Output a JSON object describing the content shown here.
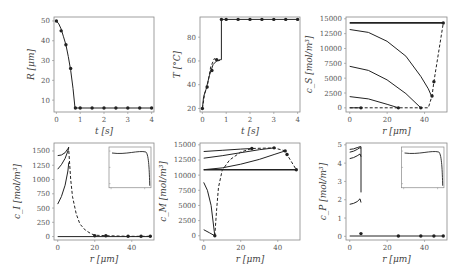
{
  "chart_data": [
    {
      "type": "line",
      "id": "radius",
      "xlabel": "t [s]",
      "ylabel": "R [μm]",
      "xlim": [
        -0.1,
        4.1
      ],
      "ylim": [
        4,
        52
      ],
      "xticks": [
        0,
        1,
        2,
        3,
        4
      ],
      "yticks": [
        10,
        20,
        30,
        40,
        50
      ],
      "series": [
        {
          "name": "solid",
          "style": "solid",
          "x": [
            0,
            0.1,
            0.2,
            0.3,
            0.4,
            0.5,
            0.6,
            0.7,
            0.78,
            0.8,
            1,
            1.5,
            2,
            2.5,
            3,
            3.5,
            4
          ],
          "y": [
            50,
            48.5,
            46,
            42,
            38,
            32,
            25,
            16,
            6,
            6,
            6,
            6,
            6,
            6,
            6,
            6,
            6
          ]
        },
        {
          "name": "markers",
          "style": "markers",
          "x": [
            0,
            0.2,
            0.4,
            0.6,
            0.8,
            1,
            1.5,
            2,
            2.5,
            3,
            3.5,
            4
          ],
          "y": [
            50,
            45,
            38,
            26,
            6,
            6,
            6,
            6,
            6,
            6,
            6,
            6
          ]
        }
      ]
    },
    {
      "type": "line",
      "id": "temperature",
      "xlabel": "t [s]",
      "ylabel": "T [°C]",
      "xlim": [
        -0.1,
        4.1
      ],
      "ylim": [
        17,
        97
      ],
      "xticks": [
        0,
        1,
        2,
        3,
        4
      ],
      "yticks": [
        20,
        40,
        60,
        80
      ],
      "series": [
        {
          "name": "solid",
          "style": "solid",
          "x": [
            0,
            0.05,
            0.15,
            0.3,
            0.45,
            0.6,
            0.75,
            0.8,
            0.8,
            4
          ],
          "y": [
            20,
            30,
            36,
            48,
            57,
            60,
            61,
            61,
            95,
            95
          ]
        },
        {
          "name": "dashed",
          "style": "dashed",
          "x": [
            0,
            0.1,
            0.2,
            0.35,
            0.5,
            0.65,
            0.8
          ],
          "y": [
            20,
            33,
            38,
            55,
            62,
            60,
            61
          ]
        },
        {
          "name": "markers",
          "style": "markers",
          "x": [
            0,
            0.2,
            0.4,
            0.6,
            0.8,
            1,
            1.5,
            2,
            2.5,
            3,
            3.5,
            4
          ],
          "y": [
            20,
            38,
            52,
            61,
            95,
            95,
            95,
            95,
            95,
            95,
            95,
            95
          ]
        }
      ]
    },
    {
      "type": "line",
      "id": "c_S",
      "xlabel": "r [μm]",
      "ylabel": "c_S [mol/m³]",
      "xlim": [
        -2,
        52
      ],
      "ylim": [
        -700,
        15300
      ],
      "xticks": [
        0,
        20,
        40
      ],
      "yticks": [
        0,
        2500,
        5000,
        7500,
        10000,
        12500,
        15000
      ],
      "series": [
        {
          "name": "t0",
          "style": "solid",
          "x": [
            0,
            50
          ],
          "y": [
            14300,
            14300
          ]
        },
        {
          "name": "t1",
          "style": "solid",
          "x": [
            0,
            10,
            20,
            30,
            38,
            42,
            44
          ],
          "y": [
            13200,
            12700,
            11200,
            8700,
            5300,
            3200,
            1800
          ]
        },
        {
          "name": "t2",
          "style": "solid",
          "x": [
            0,
            10,
            20,
            30,
            38
          ],
          "y": [
            7000,
            6300,
            4700,
            2400,
            0
          ]
        },
        {
          "name": "t3",
          "style": "solid",
          "x": [
            0,
            10,
            20,
            26
          ],
          "y": [
            1900,
            1500,
            600,
            0
          ]
        },
        {
          "name": "t4",
          "style": "solid",
          "x": [
            0,
            6
          ],
          "y": [
            0,
            0
          ]
        },
        {
          "name": "surface",
          "style": "dashed",
          "x": [
            0,
            6,
            26,
            38,
            42,
            44,
            45,
            50
          ],
          "y": [
            0,
            0,
            0,
            0,
            0,
            2000,
            4400,
            14300
          ]
        },
        {
          "name": "markers",
          "style": "markers",
          "x": [
            6,
            26,
            38,
            44,
            45,
            50
          ],
          "y": [
            0,
            0,
            0,
            2000,
            4400,
            14300
          ]
        }
      ]
    },
    {
      "type": "line",
      "id": "c_I",
      "xlabel": "r [μm]",
      "ylabel": "c_I [mol/m³]",
      "xlim": [
        -2,
        52
      ],
      "ylim": [
        -60,
        1640
      ],
      "xticks": [
        0,
        20,
        40
      ],
      "yticks": [
        0,
        250,
        500,
        750,
        1000,
        1250,
        1500
      ],
      "inset": true,
      "series": [
        {
          "name": "t1",
          "style": "solid",
          "x": [
            0,
            2,
            4,
            5.5,
            6
          ],
          "y": [
            1420,
            1430,
            1470,
            1540,
            1570
          ]
        },
        {
          "name": "t2",
          "style": "solid",
          "x": [
            0,
            2,
            4,
            5.5,
            6
          ],
          "y": [
            1180,
            1260,
            1370,
            1500,
            1560
          ]
        },
        {
          "name": "t3",
          "style": "solid",
          "x": [
            0,
            2,
            4,
            5.5,
            6
          ],
          "y": [
            570,
            700,
            900,
            1150,
            1300
          ]
        },
        {
          "name": "t4",
          "style": "solid",
          "x": [
            0,
            50
          ],
          "y": [
            0,
            0
          ]
        },
        {
          "name": "surface",
          "style": "dashed",
          "x": [
            6,
            7,
            8,
            10,
            12,
            15,
            18,
            20,
            26,
            38,
            45,
            50
          ],
          "y": [
            1500,
            1000,
            700,
            400,
            220,
            110,
            50,
            25,
            15,
            5,
            5,
            5
          ]
        },
        {
          "name": "markers",
          "style": "markers",
          "x": [
            20,
            26,
            38,
            45,
            50
          ],
          "y": [
            15,
            15,
            5,
            5,
            5
          ]
        }
      ]
    },
    {
      "type": "line",
      "id": "c_M",
      "xlabel": "r [μm]",
      "ylabel": "c_M [mol/m³]",
      "xlim": [
        -2,
        52
      ],
      "ylim": [
        -700,
        15300
      ],
      "xticks": [
        0,
        20,
        40
      ],
      "yticks": [
        0,
        2500,
        5000,
        7500,
        10000,
        12500,
        15000
      ],
      "series": [
        {
          "name": "t0",
          "style": "solid",
          "x": [
            0,
            50
          ],
          "y": [
            10900,
            10900
          ]
        },
        {
          "name": "t1",
          "style": "solid",
          "x": [
            0,
            10,
            20,
            30,
            38,
            44
          ],
          "y": [
            10900,
            11200,
            11800,
            12600,
            13400,
            14000
          ]
        },
        {
          "name": "t2",
          "style": "solid",
          "x": [
            0,
            10,
            20,
            30,
            38
          ],
          "y": [
            12800,
            13200,
            13700,
            14200,
            14500
          ]
        },
        {
          "name": "t3",
          "style": "solid",
          "x": [
            0,
            10,
            20,
            26
          ],
          "y": [
            13900,
            14100,
            14300,
            14400
          ]
        },
        {
          "name": "t4",
          "style": "solid",
          "x": [
            0,
            2,
            4,
            6
          ],
          "y": [
            8800,
            7500,
            5000,
            0
          ]
        },
        {
          "name": "t5",
          "style": "solid",
          "x": [
            0,
            3,
            6
          ],
          "y": [
            1000,
            500,
            0
          ]
        },
        {
          "name": "surface",
          "style": "dashed",
          "x": [
            6,
            7,
            8,
            10,
            14,
            20,
            26,
            38,
            44,
            45,
            50
          ],
          "y": [
            0,
            4500,
            8000,
            10800,
            12500,
            13800,
            14400,
            14500,
            14000,
            13400,
            10900
          ]
        },
        {
          "name": "markers",
          "style": "markers",
          "x": [
            6,
            26,
            38,
            44,
            45,
            50
          ],
          "y": [
            0,
            14400,
            14500,
            14000,
            13400,
            10900
          ]
        }
      ]
    },
    {
      "type": "line",
      "id": "c_P",
      "xlabel": "r [μm]",
      "ylabel": "c_P [mol/m³]",
      "xlim": [
        -2,
        52
      ],
      "ylim": [
        -0.2,
        5.1
      ],
      "xticks": [
        0,
        20,
        40
      ],
      "yticks": [
        0,
        1,
        2,
        3,
        4,
        5
      ],
      "inset": true,
      "series": [
        {
          "name": "t1",
          "style": "solid",
          "x": [
            0,
            2,
            4,
            5.5,
            6,
            6
          ],
          "y": [
            4.75,
            4.78,
            4.85,
            4.9,
            4.9,
            2.4
          ]
        },
        {
          "name": "t2",
          "style": "solid",
          "x": [
            0,
            2,
            4,
            5.5,
            6
          ],
          "y": [
            4.6,
            4.65,
            4.75,
            4.85,
            4.8
          ]
        },
        {
          "name": "t3",
          "style": "solid",
          "x": [
            0,
            2,
            4,
            5.5,
            6
          ],
          "y": [
            4.25,
            4.3,
            4.4,
            4.5,
            4.35
          ]
        },
        {
          "name": "t4",
          "style": "solid",
          "x": [
            0,
            2,
            4,
            5.5,
            6
          ],
          "y": [
            1.75,
            1.8,
            1.9,
            2.05,
            1.85
          ]
        },
        {
          "name": "t5",
          "style": "solid",
          "x": [
            0,
            50
          ],
          "y": [
            0.02,
            0.02
          ]
        },
        {
          "name": "markers",
          "style": "markers",
          "x": [
            6,
            26,
            38,
            45,
            50
          ],
          "y": [
            0.15,
            0.02,
            0.02,
            0.02,
            0.02
          ]
        }
      ]
    }
  ],
  "panels": [
    {
      "ylabel": "R [μm]",
      "xlabel": "t [s]",
      "xticks": [
        "0",
        "1",
        "2",
        "3",
        "4"
      ],
      "yticks": [
        "10",
        "20",
        "30",
        "40",
        "50"
      ]
    },
    {
      "ylabel": "T [°C]",
      "xlabel": "t [s]",
      "xticks": [
        "0",
        "1",
        "2",
        "3",
        "4"
      ],
      "yticks": [
        "20",
        "40",
        "60",
        "80"
      ]
    },
    {
      "ylabel": "c_S [mol/m³]",
      "xlabel": "r [μm]",
      "xticks": [
        "0",
        "20",
        "40"
      ],
      "yticks": [
        "0",
        "2500",
        "5000",
        "7500",
        "10000",
        "12500",
        "15000"
      ]
    },
    {
      "ylabel": "c_I [mol/m³]",
      "xlabel": "r [μm]",
      "xticks": [
        "0",
        "20",
        "40"
      ],
      "yticks": [
        "0",
        "250",
        "500",
        "750",
        "1000",
        "1250",
        "1500"
      ]
    },
    {
      "ylabel": "c_M [mol/m³]",
      "xlabel": "r [μm]",
      "xticks": [
        "0",
        "20",
        "40"
      ],
      "yticks": [
        "0",
        "2500",
        "5000",
        "7500",
        "10000",
        "12500",
        "15000"
      ]
    },
    {
      "ylabel": "c_P [mol/m³]",
      "xlabel": "r [μm]",
      "xticks": [
        "0",
        "20",
        "40"
      ],
      "yticks": [
        "0",
        "1",
        "2",
        "3",
        "4",
        "5"
      ]
    }
  ],
  "colors": {
    "line": "#222222",
    "axis": "#888888",
    "text": "#555555"
  }
}
